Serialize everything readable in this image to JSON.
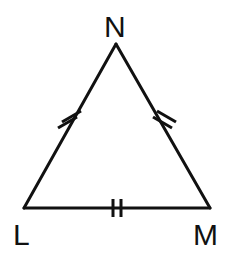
{
  "figure": {
    "kind": "geometry-diagram",
    "shape": "triangle",
    "name": "triangle-LMN",
    "background_color": "#ffffff",
    "stroke_color": "#111111",
    "stroke_width": 3
  },
  "vertices": [
    {
      "id": "N",
      "label": "N",
      "x": 116,
      "y": 44,
      "label_x": 104,
      "label_y": 12,
      "role": "apex"
    },
    {
      "id": "L",
      "label": "L",
      "x": 24,
      "y": 208,
      "label_x": 13,
      "label_y": 220,
      "role": "bottom-left"
    },
    {
      "id": "M",
      "label": "M",
      "x": 210,
      "y": 208,
      "label_x": 193,
      "label_y": 220,
      "role": "bottom-right"
    }
  ],
  "sides": [
    {
      "id": "LN",
      "name": "side-left",
      "from": "L",
      "to": "N",
      "tick_marks": 2,
      "tick_label": "double tick",
      "midpoint_x": 70,
      "midpoint_y": 126
    },
    {
      "id": "NM",
      "name": "side-right",
      "from": "N",
      "to": "M",
      "tick_marks": 2,
      "tick_label": "double tick",
      "midpoint_x": 163,
      "midpoint_y": 126
    },
    {
      "id": "LM",
      "name": "side-bottom",
      "from": "L",
      "to": "M",
      "tick_marks": 2,
      "tick_label": "double tick",
      "midpoint_x": 117,
      "midpoint_y": 208
    }
  ],
  "tick_style": {
    "length": 20,
    "width": 3,
    "separation": 7,
    "color": "#111111"
  }
}
